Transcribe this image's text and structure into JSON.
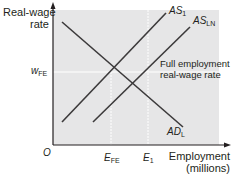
{
  "diagram": {
    "type": "labor-market-diagram",
    "y_axis": {
      "label_line1": "Real-wage",
      "label_line2": "rate"
    },
    "x_axis": {
      "label_line1": "Employment",
      "label_line2": "(millions)"
    },
    "origin_label": "O",
    "curves": [
      {
        "id": "AS1",
        "base": "AS",
        "sub": "1",
        "kind": "aggregate supply of labor (initial)"
      },
      {
        "id": "ASLN",
        "base": "AS",
        "sub": "LN",
        "kind": "aggregate supply of labor (shifted)"
      },
      {
        "id": "ADL",
        "base": "AD",
        "sub": "L",
        "kind": "aggregate demand for labor"
      }
    ],
    "reference_lines": {
      "wage": {
        "base": "w",
        "sub": "FE",
        "note_line1": "Full employment",
        "note_line2": "real-wage rate"
      },
      "employment": [
        {
          "base": "E",
          "sub": "FE"
        },
        {
          "base": "E",
          "sub": "1"
        }
      ]
    },
    "colors": {
      "plot_background": "#e6e6e7",
      "line": "#3c3a3b",
      "reference_line": "#ffffff",
      "text": "#231f20"
    }
  }
}
